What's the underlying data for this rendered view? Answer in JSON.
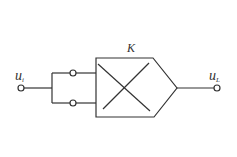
{
  "diagram": {
    "title": "",
    "stroke_color": "#333333",
    "background": "#ffffff",
    "labels": {
      "input": {
        "base": "u",
        "subscript": "i"
      },
      "output": {
        "base": "u",
        "subscript": "L"
      },
      "block": "K"
    },
    "components": [
      {
        "id": "input-terminal",
        "type": "terminal",
        "x": 21,
        "y": 88
      },
      {
        "id": "branch-upper-terminal",
        "type": "terminal",
        "x": 73,
        "y": 73
      },
      {
        "id": "branch-lower-terminal",
        "type": "terminal",
        "x": 73,
        "y": 103
      },
      {
        "id": "amplifier-block",
        "type": "multiplier-amplifier",
        "label": "K"
      },
      {
        "id": "output-terminal",
        "type": "terminal",
        "x": 217,
        "y": 88
      }
    ]
  }
}
